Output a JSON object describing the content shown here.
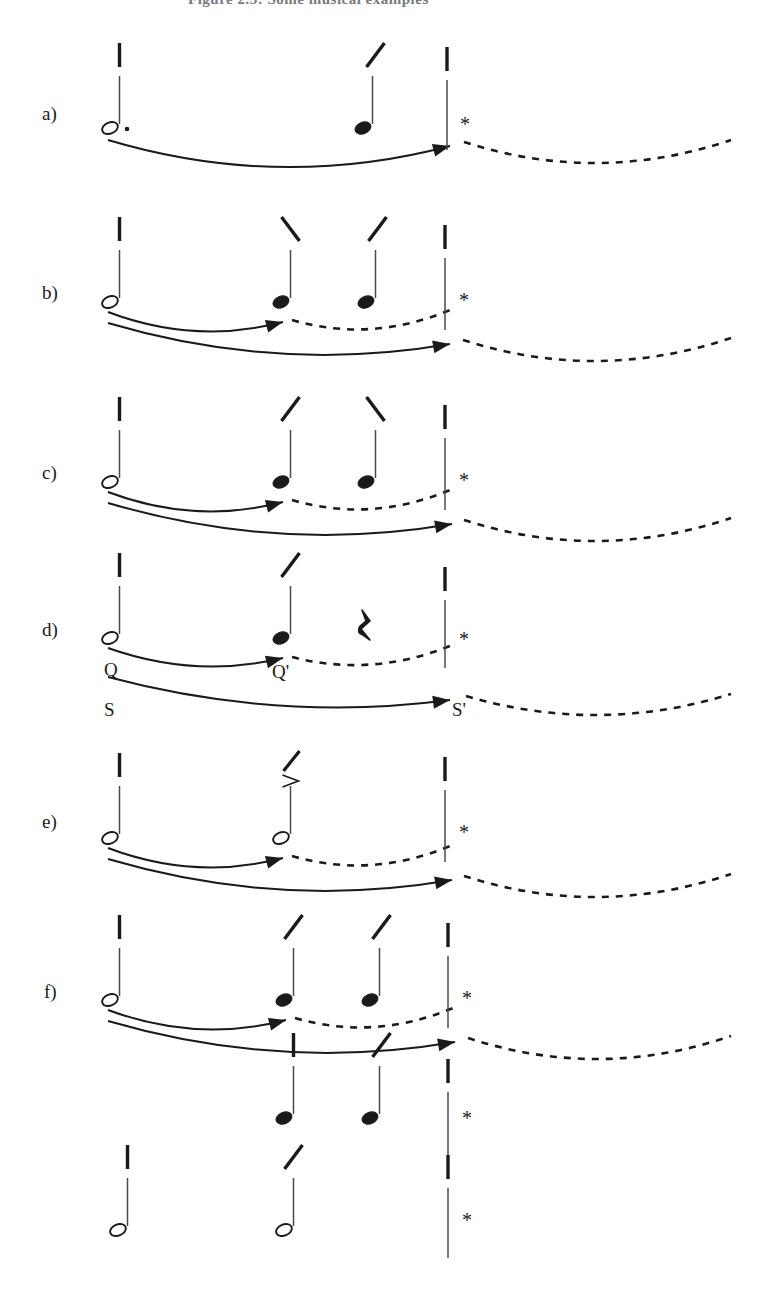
{
  "figure": {
    "caption_partial": "Figure 2.3: Some musical examples",
    "width": 774,
    "height": 1304,
    "background": "#ffffff",
    "ink_color": "#1a1a1a",
    "note_stem_color": "#4a4a4a"
  },
  "symbols": {
    "asterisk": "*",
    "quarter_rest": "⸮",
    "accent_gt": ">",
    "tick": "|",
    "slash_up": "/",
    "slash_down": "\\",
    "dot": "."
  },
  "legend": {
    "hollow_notehead": "half-note",
    "filled_notehead": "quarter-note",
    "dotted_note": "dotted-half-note",
    "barline": "barline",
    "solid_arc": "solid-arrow-arc",
    "dashed_arc": "dashed-arc-continuation"
  },
  "rows": [
    {
      "id": "a",
      "label": "a)",
      "label_x": 42,
      "label_y": 104,
      "baseline": 128,
      "notes": [
        {
          "name": "note-1",
          "x": 110,
          "type": "hollow",
          "dotted": true,
          "tick": "bar",
          "tick_x": 110
        },
        {
          "name": "note-2",
          "x": 363,
          "type": "filled",
          "dotted": false,
          "tick": "slash-up",
          "tick_x": 366
        }
      ],
      "barline": {
        "x": 447,
        "top": 80,
        "bottom": 150,
        "tick": "bar",
        "asterisk_x": 460,
        "asterisk_y": 126
      },
      "arcs": [
        {
          "name": "arc-solid-outer",
          "kind": "solid",
          "x1": 108,
          "y1": 140,
          "x2": 450,
          "y2": 146,
          "sag": 24,
          "arrow": true
        },
        {
          "name": "arc-dashed-tail",
          "kind": "dashed",
          "x1": 464,
          "y1": 142,
          "x2": 731,
          "y2": 140,
          "sag": 22,
          "arrow": false
        }
      ],
      "rest": null,
      "arc_labels": []
    },
    {
      "id": "b",
      "label": "b)",
      "label_x": 42,
      "label_y": 283,
      "baseline": 302,
      "notes": [
        {
          "name": "note-1",
          "x": 110,
          "type": "hollow",
          "dotted": false,
          "tick": "bar",
          "tick_x": 110
        },
        {
          "name": "note-2",
          "x": 281,
          "type": "filled",
          "dotted": false,
          "tick": "slash-down",
          "tick_x": 281
        },
        {
          "name": "note-3",
          "x": 366,
          "type": "filled",
          "dotted": false,
          "tick": "slash-up",
          "tick_x": 368
        }
      ],
      "barline": {
        "x": 445,
        "top": 258,
        "bottom": 330,
        "tick": "bar",
        "asterisk_x": 459,
        "asterisk_y": 302
      },
      "arcs": [
        {
          "name": "arc-solid-inner",
          "kind": "solid",
          "x1": 108,
          "y1": 312,
          "x2": 283,
          "y2": 322,
          "sag": 14,
          "arrow": true
        },
        {
          "name": "arc-dashed-inner",
          "kind": "dashed",
          "x1": 292,
          "y1": 320,
          "x2": 450,
          "y2": 310,
          "sag": 14,
          "arrow": false
        },
        {
          "name": "arc-solid-outer",
          "kind": "solid",
          "x1": 108,
          "y1": 323,
          "x2": 450,
          "y2": 344,
          "sag": 20,
          "arrow": true
        },
        {
          "name": "arc-dashed-tail",
          "kind": "dashed",
          "x1": 463,
          "y1": 340,
          "x2": 731,
          "y2": 338,
          "sag": 22,
          "arrow": false
        }
      ],
      "rest": null,
      "arc_labels": []
    },
    {
      "id": "c",
      "label": "c)",
      "label_x": 42,
      "label_y": 463,
      "baseline": 482,
      "notes": [
        {
          "name": "note-1",
          "x": 110,
          "type": "hollow",
          "dotted": false,
          "tick": "bar",
          "tick_x": 110
        },
        {
          "name": "note-2",
          "x": 281,
          "type": "filled",
          "dotted": false,
          "tick": "slash-up",
          "tick_x": 281
        },
        {
          "name": "note-3",
          "x": 366,
          "type": "filled",
          "dotted": false,
          "tick": "slash-down",
          "tick_x": 366
        }
      ],
      "barline": {
        "x": 445,
        "top": 438,
        "bottom": 510,
        "tick": "bar",
        "asterisk_x": 459,
        "asterisk_y": 482
      },
      "arcs": [
        {
          "name": "arc-solid-inner",
          "kind": "solid",
          "x1": 108,
          "y1": 492,
          "x2": 283,
          "y2": 502,
          "sag": 14,
          "arrow": true
        },
        {
          "name": "arc-dashed-inner",
          "kind": "dashed",
          "x1": 292,
          "y1": 500,
          "x2": 450,
          "y2": 490,
          "sag": 14,
          "arrow": false
        },
        {
          "name": "arc-solid-outer",
          "kind": "solid",
          "x1": 108,
          "y1": 503,
          "x2": 452,
          "y2": 524,
          "sag": 20,
          "arrow": true
        },
        {
          "name": "arc-dashed-tail",
          "kind": "dashed",
          "x1": 464,
          "y1": 520,
          "x2": 731,
          "y2": 518,
          "sag": 22,
          "arrow": false
        }
      ],
      "rest": null,
      "arc_labels": []
    },
    {
      "id": "d",
      "label": "d)",
      "label_x": 42,
      "label_y": 620,
      "baseline": 638,
      "notes": [
        {
          "name": "note-1",
          "x": 110,
          "type": "hollow",
          "dotted": false,
          "tick": "bar",
          "tick_x": 110
        },
        {
          "name": "note-2",
          "x": 281,
          "type": "filled",
          "dotted": false,
          "tick": "slash-up",
          "tick_x": 281
        }
      ],
      "barline": {
        "x": 445,
        "top": 600,
        "bottom": 668,
        "tick": "bar",
        "asterisk_x": 459,
        "asterisk_y": 641
      },
      "arcs": [
        {
          "name": "arc-solid-inner",
          "kind": "solid",
          "x1": 108,
          "y1": 648,
          "x2": 283,
          "y2": 658,
          "sag": 13,
          "arrow": true
        },
        {
          "name": "arc-dashed-inner",
          "kind": "dashed",
          "x1": 292,
          "y1": 657,
          "x2": 450,
          "y2": 646,
          "sag": 13,
          "arrow": false
        },
        {
          "name": "arc-solid-outer",
          "kind": "solid",
          "x1": 108,
          "y1": 677,
          "x2": 450,
          "y2": 700,
          "sag": 17,
          "arrow": true
        },
        {
          "name": "arc-dashed-tail",
          "kind": "dashed",
          "x1": 466,
          "y1": 696,
          "x2": 731,
          "y2": 694,
          "sag": 20,
          "arrow": false
        }
      ],
      "rest": {
        "name": "quarter-rest",
        "x": 365,
        "y": 628
      },
      "arc_labels": [
        {
          "name": "arc-label-Q",
          "text": "Q",
          "x": 104,
          "y": 660
        },
        {
          "name": "arc-label-Q-prime",
          "text": "Q'",
          "x": 272,
          "y": 662
        },
        {
          "name": "arc-label-S",
          "text": "S",
          "x": 104,
          "y": 700
        },
        {
          "name": "arc-label-S-prime",
          "text": "S'",
          "x": 452,
          "y": 700
        }
      ]
    },
    {
      "id": "e",
      "label": "e)",
      "label_x": 42,
      "label_y": 812,
      "baseline": 838,
      "notes": [
        {
          "name": "note-1",
          "x": 110,
          "type": "hollow",
          "dotted": false,
          "tick": "bar",
          "tick_x": 110
        },
        {
          "name": "note-2",
          "x": 281,
          "type": "hollow",
          "dotted": false,
          "tick": "slash-up-accent",
          "tick_x": 283
        }
      ],
      "barline": {
        "x": 445,
        "top": 790,
        "bottom": 862,
        "tick": "bar",
        "asterisk_x": 459,
        "asterisk_y": 834
      },
      "arcs": [
        {
          "name": "arc-solid-inner",
          "kind": "solid",
          "x1": 108,
          "y1": 848,
          "x2": 283,
          "y2": 858,
          "sag": 14,
          "arrow": true
        },
        {
          "name": "arc-dashed-inner",
          "kind": "dashed",
          "x1": 292,
          "y1": 856,
          "x2": 450,
          "y2": 846,
          "sag": 14,
          "arrow": false
        },
        {
          "name": "arc-solid-outer",
          "kind": "solid",
          "x1": 108,
          "y1": 859,
          "x2": 452,
          "y2": 880,
          "sag": 20,
          "arrow": true
        },
        {
          "name": "arc-dashed-tail",
          "kind": "dashed",
          "x1": 464,
          "y1": 876,
          "x2": 731,
          "y2": 874,
          "sag": 22,
          "arrow": false
        }
      ],
      "rest": null,
      "arc_labels": []
    },
    {
      "id": "f",
      "label": "f)",
      "label_x": 44,
      "label_y": 982,
      "baseline": 1000,
      "notes": [
        {
          "name": "note-1",
          "x": 110,
          "type": "hollow",
          "dotted": false,
          "tick": "bar",
          "tick_x": 110
        },
        {
          "name": "note-2",
          "x": 284,
          "type": "filled",
          "dotted": false,
          "tick": "slash-up",
          "tick_x": 284
        },
        {
          "name": "note-3",
          "x": 370,
          "type": "filled",
          "dotted": false,
          "tick": "slash-up",
          "tick_x": 372
        }
      ],
      "barline": {
        "x": 448,
        "top": 956,
        "bottom": 1028,
        "tick": "bar",
        "asterisk_x": 462,
        "asterisk_y": 1000
      },
      "arcs": [
        {
          "name": "arc-solid-inner",
          "kind": "solid",
          "x1": 108,
          "y1": 1010,
          "x2": 286,
          "y2": 1020,
          "sag": 14,
          "arrow": true
        },
        {
          "name": "arc-dashed-inner",
          "kind": "dashed",
          "x1": 295,
          "y1": 1018,
          "x2": 453,
          "y2": 1008,
          "sag": 14,
          "arrow": false
        },
        {
          "name": "arc-solid-outer",
          "kind": "solid",
          "x1": 108,
          "y1": 1021,
          "x2": 455,
          "y2": 1042,
          "sag": 20,
          "arrow": true
        },
        {
          "name": "arc-dashed-tail",
          "kind": "dashed",
          "x1": 468,
          "y1": 1038,
          "x2": 731,
          "y2": 1036,
          "sag": 22,
          "arrow": false
        }
      ],
      "rest": null,
      "arc_labels": []
    },
    {
      "id": "g",
      "label": "",
      "label_x": 0,
      "label_y": 0,
      "baseline": 1118,
      "notes": [
        {
          "name": "note-1",
          "x": 284,
          "type": "filled",
          "dotted": false,
          "tick": "bar",
          "tick_x": 284
        },
        {
          "name": "note-2",
          "x": 370,
          "type": "filled",
          "dotted": false,
          "tick": "slash-up",
          "tick_x": 372
        }
      ],
      "barline": {
        "x": 448,
        "top": 1092,
        "bottom": 1160,
        "tick": "bar",
        "asterisk_x": 462,
        "asterisk_y": 1120
      },
      "arcs": [],
      "rest": null,
      "arc_labels": []
    },
    {
      "id": "h",
      "label": "",
      "label_x": 0,
      "label_y": 0,
      "baseline": 1230,
      "notes": [
        {
          "name": "note-1",
          "x": 118,
          "type": "hollow",
          "dotted": false,
          "tick": "bar",
          "tick_x": 118
        },
        {
          "name": "note-2",
          "x": 284,
          "type": "hollow",
          "dotted": false,
          "tick": "slash-up",
          "tick_x": 284
        }
      ],
      "barline": {
        "x": 448,
        "top": 1188,
        "bottom": 1258,
        "tick": "bar",
        "asterisk_x": 462,
        "asterisk_y": 1222
      },
      "arcs": [],
      "rest": null,
      "arc_labels": []
    }
  ]
}
